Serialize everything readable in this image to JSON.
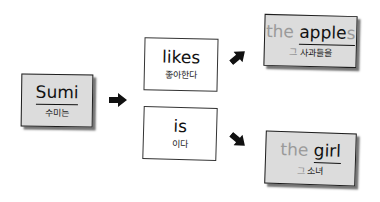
{
  "diagram": {
    "subject": {
      "word": "Sumi",
      "translation": "수미는"
    },
    "verbs": [
      {
        "word": "likes",
        "translation": "좋아한다"
      },
      {
        "word": "is",
        "translation": "이다"
      }
    ],
    "objects": [
      {
        "article": "the",
        "word_main": "apple",
        "word_suffix": "s",
        "article_ko": "그",
        "translation": "사과들을"
      },
      {
        "article": "the",
        "word_main": "girl",
        "word_suffix": "",
        "article_ko": "그",
        "translation": "소녀"
      }
    ],
    "arrows": [
      {
        "name": "subject-to-verbs",
        "direction": "right"
      },
      {
        "name": "likes-to-apples",
        "direction": "up-right"
      },
      {
        "name": "is-to-girl",
        "direction": "down-right"
      }
    ]
  }
}
